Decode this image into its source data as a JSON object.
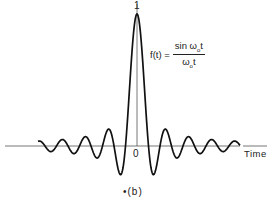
{
  "figure": {
    "tick_top": "1",
    "tick_origin": "0",
    "xlabel": "Time",
    "caption": "•(b)",
    "formula": {
      "lhs": "f(t) =",
      "num_text": "sin  ω",
      "num_sub": "o",
      "num_tail": "t",
      "den_text": "ω",
      "den_sub": "o",
      "den_tail": "t"
    }
  },
  "chart_data": {
    "type": "line",
    "title": "",
    "function": "f(t) = sin(ω0 t) / (ω0 t)",
    "xlabel": "Time",
    "ylabel": "",
    "x_ticks": [
      "0"
    ],
    "y_ticks": [
      "1"
    ],
    "x_range_in_units_of_pi_over_w0": [
      -8,
      8.5
    ],
    "ylim": [
      -0.25,
      1.0
    ],
    "grid": false,
    "legend": null,
    "caption": "(b)",
    "key_points": [
      {
        "t": 0,
        "f": 1.0
      },
      {
        "t_over_pi": -1,
        "f": 0
      },
      {
        "t_over_pi": 1,
        "f": 0
      },
      {
        "t_over_pi": -1.43,
        "f": -0.217
      },
      {
        "t_over_pi": 1.43,
        "f": -0.217
      },
      {
        "t_over_pi": -2.46,
        "f": 0.128
      },
      {
        "t_over_pi": 2.46,
        "f": 0.128
      }
    ],
    "render": {
      "x0_px": 137,
      "baseline_px": 146,
      "amp_px": 132,
      "px_per_pi": 11.5,
      "xmin_px": 38,
      "xmax_px": 240,
      "axis_left_px": 5,
      "axis_right_px": 240,
      "axis_right2_px": 243,
      "vline_top_px": 4,
      "stroke": "#111111",
      "axis_color": "#555555"
    }
  }
}
